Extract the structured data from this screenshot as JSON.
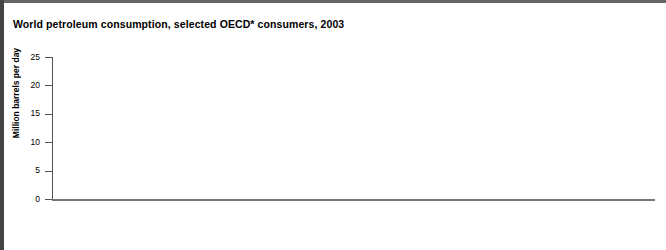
{
  "title": "World petroleum consumption, selected OECD* consumers, 2003",
  "chart_data": {
    "type": "bar",
    "title": "World petroleum consumption, selected OECD* consumers, 2003",
    "xlabel": "",
    "ylabel": "Million barrels per day",
    "ylim": [
      0,
      25
    ],
    "yticks": [
      0,
      5,
      10,
      15,
      20,
      25
    ],
    "ytick_labels": [
      "0",
      "5",
      "10",
      "15",
      "20",
      "25"
    ],
    "grid": false,
    "legend": false,
    "bar_color": "#9a9a9a",
    "bar_border_color": "#5d5d5d",
    "categories": [
      "United States",
      "Japan",
      "China",
      "Russia",
      "Germany",
      "India",
      "Canada",
      "South Korea",
      "Brazil",
      "France",
      "Mexico",
      "Italy",
      "United Kingdom",
      "Spain"
    ],
    "values": [
      20.0,
      5.6,
      5.6,
      2.7,
      2.7,
      2.3,
      2.2,
      2.2,
      2.1,
      2.1,
      2.0,
      1.9,
      1.7,
      1.5
    ],
    "value_labels": [
      "20.0",
      "5.6",
      "5.6",
      "2.7",
      "2.7",
      "2.3",
      "2.2",
      "2.2",
      "2.1",
      "2.1",
      "2.0",
      "1.9",
      "1.7",
      "1.5"
    ]
  }
}
